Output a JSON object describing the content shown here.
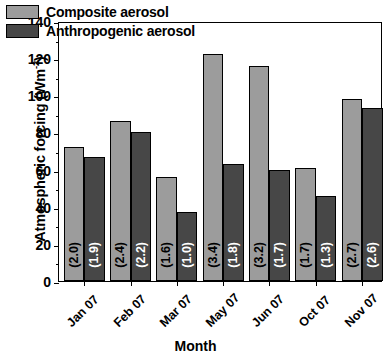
{
  "chart_data": {
    "type": "bar",
    "title": "",
    "xlabel": "Month",
    "ylabel": "Atmospheric forcing (Wm",
    "ylabel_sup": "-2",
    "ylabel_close": ")",
    "categories": [
      "Jan 07",
      "Feb 07",
      "Mar 07",
      "May 07",
      "Jun 07",
      "Oct 07",
      "Nov 07"
    ],
    "ylim": [
      0,
      140
    ],
    "yticks": [
      0,
      20,
      40,
      60,
      80,
      100,
      120,
      140
    ],
    "ytick_labels": [
      "0",
      "20",
      "40",
      "60",
      "80",
      "100",
      "120",
      "140"
    ],
    "yminor_ticks": [
      10,
      30,
      50,
      70,
      90,
      110,
      130
    ],
    "grid": false,
    "legend_position": "top-left",
    "series": [
      {
        "name": "Composite aerosol",
        "color": "#9c9c9c",
        "values": [
          72,
          86,
          56,
          122,
          116,
          61,
          98
        ],
        "point_labels": [
          "(2.0)",
          "(2.4)",
          "(1.6)",
          "(3.4)",
          "(3.2)",
          "(1.7)",
          "(2.7)"
        ]
      },
      {
        "name": "Anthropogenic aerosol",
        "color": "#474747",
        "values": [
          67,
          80,
          37,
          63,
          60,
          46,
          93
        ],
        "point_labels": [
          "(1.9)",
          "(2.2)",
          "(1.0)",
          "(1.8)",
          "(1.7)",
          "(1.3)",
          "(2.6)"
        ]
      }
    ]
  },
  "legend": {
    "items": [
      {
        "label": "Composite aerosol",
        "color": "#9c9c9c"
      },
      {
        "label": "Anthropogenic aerosol",
        "color": "#474747"
      }
    ]
  },
  "colors": {
    "composite": "#9c9c9c",
    "anthropogenic": "#474747",
    "axis": "#000000",
    "background": "#ffffff"
  }
}
